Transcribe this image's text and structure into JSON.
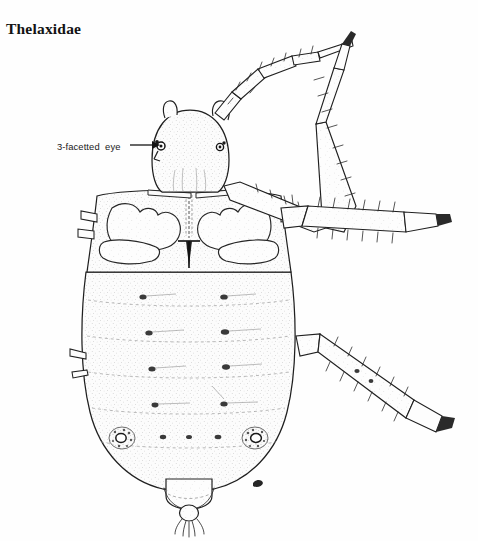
{
  "figure": {
    "family_title": "Thelaxidae",
    "view": "dorsal habitus line drawing",
    "ink_color": "#1a1a1a",
    "background_color": "#ffffff",
    "fill_color": "#fbfbfb",
    "stipple_color": "#9a9a9a"
  },
  "annotations": [
    {
      "id": "eye-callout",
      "label": "3-facetted  eye",
      "leader": "arrow",
      "points_to": "compound-eye-3-facets",
      "arrow_from_x": 131,
      "arrow_from_y": 145,
      "arrow_to_x": 159,
      "arrow_to_y": 145
    }
  ],
  "anatomy": {
    "head": "head-capsule",
    "eye": "3-facetted-eye",
    "antenna": "antenna-segmented",
    "thorax": "thoracic-sclerites",
    "rostrum": "rostrum-stylet",
    "abdomen": "abdomen",
    "siphunculi": "siphunculus-pore",
    "cauda": "cauda-setose",
    "anal_plate": "anal-plate",
    "legs": [
      "fore-leg",
      "mid-leg",
      "hind-leg"
    ],
    "setae": "marginal-setae",
    "spots": "dorsal-setal-bases"
  }
}
